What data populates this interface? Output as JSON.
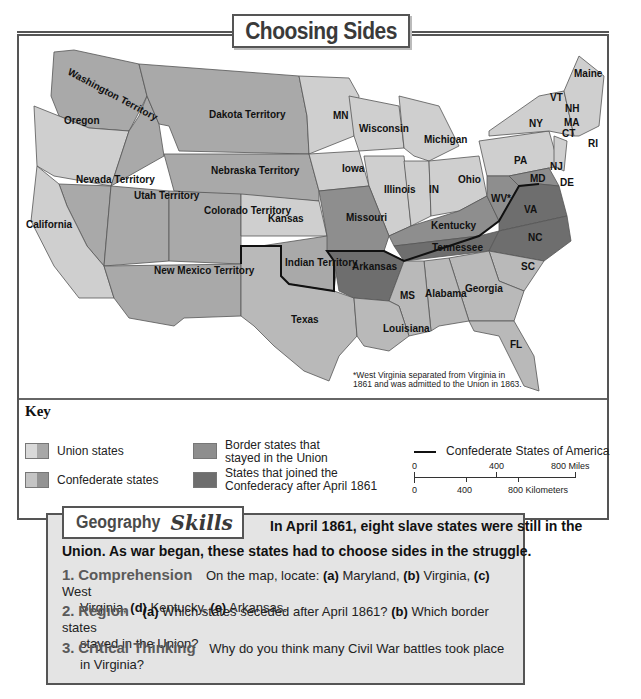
{
  "title": "Choosing Sides",
  "map": {
    "regions": {
      "washington": "Washington Territory",
      "oregon": "Oregon",
      "dakota": "Dakota Territory",
      "nebraska": "Nebraska Territory",
      "nevada": "Nevada Territory",
      "utah": "Utah Territory",
      "colorado": "Colorado Territory",
      "california": "California",
      "kansas": "Kansas",
      "new_mexico": "New Mexico Territory",
      "indian": "Indian Territory",
      "texas": "Texas",
      "mn": "MN",
      "wisconsin": "Wisconsin",
      "michigan": "Michigan",
      "iowa": "Iowa",
      "illinois": "Illinois",
      "in": "IN",
      "ohio": "Ohio",
      "pa": "PA",
      "ny": "NY",
      "maine": "Maine",
      "vt": "VT",
      "nh": "NH",
      "ma": "MA",
      "ct": "CT",
      "ri": "RI",
      "nj": "NJ",
      "de": "DE",
      "md": "MD",
      "wv": "WV*",
      "va": "VA",
      "missouri": "Missouri",
      "kentucky": "Kentucky",
      "tennessee": "Tennessee",
      "nc": "NC",
      "sc": "SC",
      "arkansas": "Arkansas",
      "ms": "MS",
      "alabama": "Alabama",
      "georgia": "Georgia",
      "louisiana": "Louisiana",
      "fl": "FL"
    },
    "footnote_line1": "*West Virginia separated from Virginia in",
    "footnote_line2": "1861 and was admitted to the Union in 1863."
  },
  "key": {
    "title": "Key",
    "items": [
      {
        "label": "Union states",
        "color": "#cfcfcf"
      },
      {
        "label": "Confederate states",
        "color": "#b9b9b9"
      },
      {
        "label_line1": "Border states that",
        "label_line2": "stayed in the Union",
        "color": "#8e8e8e"
      },
      {
        "label_line1": "States that joined the",
        "label_line2": "Confederacy after April 1861",
        "color": "#6e6e6e"
      }
    ],
    "csa_line_label": "Confederate States of America",
    "scale": {
      "miles": [
        "0",
        "400",
        "800 Miles"
      ],
      "km": [
        "0",
        "400",
        "800 Kilometers"
      ]
    }
  },
  "skills": {
    "tab_word1": "Geography",
    "tab_word2": "Skills",
    "intro_line1": "In April 1861, eight slave states were still in the",
    "intro_line2": "Union. As war began, these states had to choose sides in the struggle.",
    "questions": [
      {
        "num": "1.",
        "head": "Comprehension",
        "line1_pre": "On the map, locate:",
        "a": "(a)",
        "a_text": " Maryland, ",
        "b": "(b)",
        "b_text": " Virginia, ",
        "c": "(c)",
        "c_text": " West",
        "line2_pre": "Virginia, ",
        "d": "(d)",
        "d_text": " Kentucky, ",
        "e": "(e)",
        "e_text": " Arkansas."
      },
      {
        "num": "2.",
        "head": "Region",
        "a": "(a)",
        "a_text": " Which states seceded after April 1861? ",
        "b": "(b)",
        "b_text": " Which border states",
        "line2": "stayed in the Union?"
      },
      {
        "num": "3.",
        "head": "Critical Thinking",
        "line1": "Why do you think many Civil War battles took place",
        "line2": "in Virginia?"
      }
    ]
  }
}
